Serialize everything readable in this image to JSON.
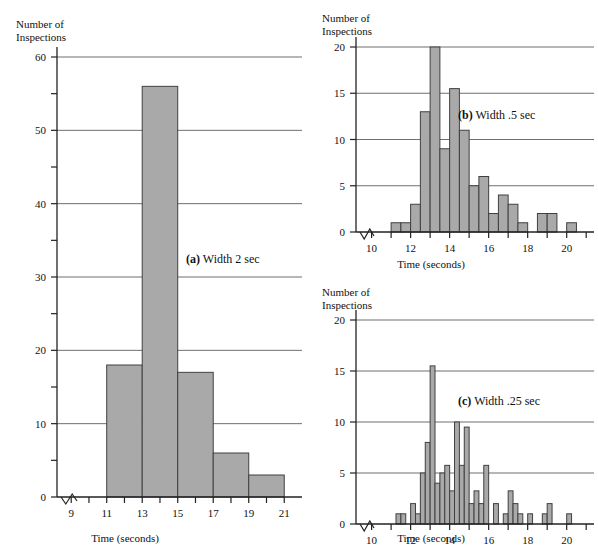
{
  "figure": {
    "y_axis_title": "Number of\nInspections",
    "x_axis_title": "Time (seconds)"
  },
  "panels": [
    {
      "id": "a",
      "caption_letter": "(a)",
      "caption_text": "Width 2 sec",
      "caption_full": "(a) Width 2 sec"
    },
    {
      "id": "b",
      "caption_letter": "(b)",
      "caption_text": "Width .5 sec",
      "caption_full": "(b) Width .5 sec"
    },
    {
      "id": "c",
      "caption_letter": "(c)",
      "caption_text": "Width .25 sec",
      "caption_full": "(c) Width .25 sec"
    }
  ],
  "chart_data": [
    {
      "id": "a",
      "type": "bar",
      "title": "(a) Width 2 sec",
      "xlabel": "Time (seconds)",
      "ylabel": "Number of Inspections",
      "bin_width": 2,
      "xlim": [
        8.2,
        22
      ],
      "ylim": [
        0,
        60
      ],
      "ytick_labels": [
        0,
        10,
        20,
        30,
        40,
        50,
        60
      ],
      "yticks_minor": [
        5,
        15,
        25,
        35,
        45,
        55
      ],
      "xtick_labels": [
        9,
        11,
        13,
        15,
        17,
        19,
        21
      ],
      "xticks_minor": [
        10,
        12,
        14,
        16,
        18,
        20
      ],
      "grid": true,
      "axis_break_x": true,
      "bins": [
        {
          "start": 11,
          "end": 13,
          "value": 18
        },
        {
          "start": 13,
          "end": 15,
          "value": 56
        },
        {
          "start": 15,
          "end": 17,
          "value": 17
        },
        {
          "start": 17,
          "end": 19,
          "value": 6
        },
        {
          "start": 19,
          "end": 21,
          "value": 3
        }
      ]
    },
    {
      "id": "b",
      "type": "bar",
      "title": "(b) Width .5 sec",
      "xlabel": "Time (seconds)",
      "ylabel": "Number of Inspections",
      "bin_width": 0.5,
      "xlim": [
        9.2,
        21.4
      ],
      "ylim": [
        0,
        20
      ],
      "ytick_labels": [
        0,
        5,
        10,
        15,
        20
      ],
      "xtick_labels": [
        10,
        12,
        14,
        16,
        18,
        20
      ],
      "xticks_minor": [
        11,
        13,
        15,
        17,
        19,
        21
      ],
      "grid": true,
      "axis_break_x": true,
      "bins": [
        {
          "start": 11.0,
          "end": 11.5,
          "value": 1
        },
        {
          "start": 11.5,
          "end": 12.0,
          "value": 1
        },
        {
          "start": 12.0,
          "end": 12.5,
          "value": 3
        },
        {
          "start": 12.5,
          "end": 13.0,
          "value": 13
        },
        {
          "start": 13.0,
          "end": 13.5,
          "value": 20
        },
        {
          "start": 13.5,
          "end": 14.0,
          "value": 9
        },
        {
          "start": 14.0,
          "end": 14.5,
          "value": 15.5
        },
        {
          "start": 14.5,
          "end": 15.0,
          "value": 11
        },
        {
          "start": 15.0,
          "end": 15.5,
          "value": 5
        },
        {
          "start": 15.5,
          "end": 16.0,
          "value": 6
        },
        {
          "start": 16.0,
          "end": 16.5,
          "value": 2
        },
        {
          "start": 16.5,
          "end": 17.0,
          "value": 4
        },
        {
          "start": 17.0,
          "end": 17.5,
          "value": 3
        },
        {
          "start": 17.5,
          "end": 18.0,
          "value": 1
        },
        {
          "start": 18.5,
          "end": 19.0,
          "value": 2
        },
        {
          "start": 19.0,
          "end": 19.5,
          "value": 2
        },
        {
          "start": 20.0,
          "end": 20.5,
          "value": 1
        }
      ]
    },
    {
      "id": "c",
      "type": "bar",
      "title": "(c) Width .25 sec",
      "xlabel": "Time (seconds)",
      "ylabel": "Number of Inspections",
      "bin_width": 0.25,
      "xlim": [
        9.2,
        21.4
      ],
      "ylim": [
        0,
        20
      ],
      "ytick_labels": [
        0,
        5,
        10,
        15,
        20
      ],
      "xtick_labels": [
        10,
        12,
        14,
        16,
        18,
        20
      ],
      "xticks_minor": [
        11,
        13,
        15,
        17,
        19,
        21
      ],
      "grid": true,
      "axis_break_x": true,
      "bins": [
        {
          "start": 11.25,
          "end": 11.5,
          "value": 1
        },
        {
          "start": 11.5,
          "end": 11.75,
          "value": 1
        },
        {
          "start": 12.0,
          "end": 12.25,
          "value": 2
        },
        {
          "start": 12.25,
          "end": 12.5,
          "value": 1
        },
        {
          "start": 12.5,
          "end": 12.75,
          "value": 5
        },
        {
          "start": 12.75,
          "end": 13.0,
          "value": 8
        },
        {
          "start": 13.0,
          "end": 13.25,
          "value": 15.5
        },
        {
          "start": 13.25,
          "end": 13.5,
          "value": 4
        },
        {
          "start": 13.5,
          "end": 13.75,
          "value": 5
        },
        {
          "start": 13.75,
          "end": 14.0,
          "value": 5.75
        },
        {
          "start": 14.0,
          "end": 14.25,
          "value": 3.25
        },
        {
          "start": 14.25,
          "end": 14.5,
          "value": 10
        },
        {
          "start": 14.5,
          "end": 14.75,
          "value": 5.75
        },
        {
          "start": 14.75,
          "end": 15.0,
          "value": 9.5
        },
        {
          "start": 15.0,
          "end": 15.25,
          "value": 2
        },
        {
          "start": 15.25,
          "end": 15.5,
          "value": 3.25
        },
        {
          "start": 15.5,
          "end": 15.75,
          "value": 2
        },
        {
          "start": 15.75,
          "end": 16.0,
          "value": 5.75
        },
        {
          "start": 16.25,
          "end": 16.5,
          "value": 2
        },
        {
          "start": 16.75,
          "end": 17.0,
          "value": 1
        },
        {
          "start": 17.0,
          "end": 17.25,
          "value": 3.25
        },
        {
          "start": 17.25,
          "end": 17.5,
          "value": 2
        },
        {
          "start": 17.5,
          "end": 17.75,
          "value": 1
        },
        {
          "start": 18.0,
          "end": 18.25,
          "value": 1
        },
        {
          "start": 18.75,
          "end": 19.0,
          "value": 1
        },
        {
          "start": 19.0,
          "end": 19.25,
          "value": 2
        },
        {
          "start": 20.0,
          "end": 20.25,
          "value": 1
        }
      ]
    }
  ]
}
